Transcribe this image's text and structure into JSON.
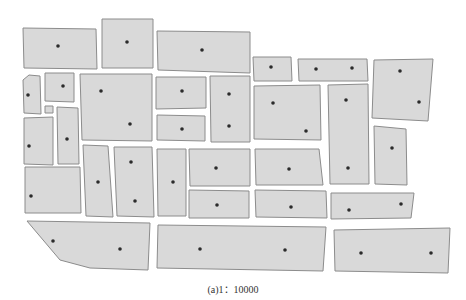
{
  "figure": {
    "caption": "(a)1：10000",
    "scale": "1:10000",
    "colors": {
      "parcel_fill": "#d9d9d9",
      "parcel_stroke": "#8c8c8c",
      "point": "#2b2b2b",
      "background": "#ffffff"
    }
  },
  "parcels": [
    {
      "id": 1,
      "poly": [
        [
          23,
          28
        ],
        [
          96,
          29
        ],
        [
          97,
          69
        ],
        [
          24,
          68
        ]
      ],
      "points": [
        [
          58,
          46
        ]
      ]
    },
    {
      "id": 2,
      "poly": [
        [
          102,
          19
        ],
        [
          153,
          19
        ],
        [
          153,
          68
        ],
        [
          102,
          68
        ]
      ],
      "points": [
        [
          127,
          42
        ]
      ]
    },
    {
      "id": 3,
      "poly": [
        [
          157,
          31
        ],
        [
          250,
          32
        ],
        [
          250,
          73
        ],
        [
          158,
          70
        ]
      ],
      "points": [
        [
          202,
          50
        ]
      ]
    },
    {
      "id": 4,
      "poly": [
        [
          253,
          57
        ],
        [
          291,
          57
        ],
        [
          292,
          81
        ],
        [
          254,
          81
        ]
      ],
      "points": [
        [
          271,
          67
        ]
      ]
    },
    {
      "id": 5,
      "poly": [
        [
          298,
          59
        ],
        [
          367,
          59
        ],
        [
          368,
          81
        ],
        [
          299,
          81
        ]
      ],
      "points": [
        [
          316,
          69
        ],
        [
          352,
          68
        ]
      ]
    },
    {
      "id": 6,
      "poly": [
        [
          374,
          60
        ],
        [
          433,
          59
        ],
        [
          428,
          121
        ],
        [
          372,
          118
        ]
      ],
      "points": [
        [
          400,
          71
        ],
        [
          419,
          102
        ]
      ]
    },
    {
      "id": 7,
      "poly": [
        [
          29,
          75
        ],
        [
          40,
          76
        ],
        [
          41,
          114
        ],
        [
          24,
          113
        ],
        [
          23,
          80
        ]
      ],
      "points": [
        [
          28,
          95
        ]
      ]
    },
    {
      "id": 8,
      "poly": [
        [
          45,
          73
        ],
        [
          74,
          73
        ],
        [
          74,
          102
        ],
        [
          45,
          101
        ]
      ],
      "points": [
        [
          63,
          86
        ]
      ]
    },
    {
      "id": 9,
      "poly": [
        [
          45,
          106
        ],
        [
          53,
          106
        ],
        [
          53,
          113
        ],
        [
          45,
          113
        ]
      ],
      "points": []
    },
    {
      "id": 10,
      "poly": [
        [
          80,
          74
        ],
        [
          152,
          74
        ],
        [
          152,
          141
        ],
        [
          82,
          140
        ]
      ],
      "points": [
        [
          101,
          91
        ],
        [
          130,
          124
        ]
      ]
    },
    {
      "id": 11,
      "poly": [
        [
          156,
          77
        ],
        [
          206,
          77
        ],
        [
          206,
          108
        ],
        [
          156,
          109
        ]
      ],
      "points": [
        [
          182,
          91
        ]
      ]
    },
    {
      "id": 12,
      "poly": [
        [
          157,
          115
        ],
        [
          205,
          116
        ],
        [
          205,
          141
        ],
        [
          157,
          140
        ]
      ],
      "points": [
        [
          182,
          129
        ]
      ]
    },
    {
      "id": 13,
      "poly": [
        [
          210,
          76
        ],
        [
          250,
          76
        ],
        [
          250,
          142
        ],
        [
          211,
          142
        ]
      ],
      "points": [
        [
          229,
          94
        ],
        [
          229,
          126
        ]
      ]
    },
    {
      "id": 14,
      "poly": [
        [
          254,
          86
        ],
        [
          320,
          85
        ],
        [
          321,
          140
        ],
        [
          254,
          139
        ]
      ],
      "points": [
        [
          273,
          103
        ],
        [
          306,
          131
        ]
      ]
    },
    {
      "id": 15,
      "poly": [
        [
          328,
          85
        ],
        [
          368,
          84
        ],
        [
          369,
          184
        ],
        [
          330,
          184
        ]
      ],
      "points": [
        [
          346,
          100
        ],
        [
          348,
          168
        ]
      ]
    },
    {
      "id": 16,
      "poly": [
        [
          374,
          126
        ],
        [
          406,
          129
        ],
        [
          407,
          185
        ],
        [
          375,
          184
        ]
      ],
      "points": [
        [
          392,
          148
        ]
      ]
    },
    {
      "id": 17,
      "poly": [
        [
          24,
          118
        ],
        [
          53,
          117
        ],
        [
          53,
          165
        ],
        [
          24,
          164
        ]
      ],
      "points": [
        [
          29,
          146
        ]
      ]
    },
    {
      "id": 18,
      "poly": [
        [
          57,
          107
        ],
        [
          78,
          108
        ],
        [
          79,
          164
        ],
        [
          58,
          164
        ]
      ],
      "points": [
        [
          67,
          139
        ]
      ]
    },
    {
      "id": 19,
      "poly": [
        [
          25,
          167
        ],
        [
          80,
          167
        ],
        [
          81,
          213
        ],
        [
          25,
          213
        ]
      ],
      "points": [
        [
          31,
          196
        ]
      ]
    },
    {
      "id": 20,
      "poly": [
        [
          83,
          145
        ],
        [
          108,
          146
        ],
        [
          113,
          217
        ],
        [
          86,
          216
        ]
      ],
      "points": [
        [
          98,
          182
        ]
      ]
    },
    {
      "id": 21,
      "poly": [
        [
          114,
          147
        ],
        [
          152,
          147
        ],
        [
          154,
          217
        ],
        [
          117,
          216
        ]
      ],
      "points": [
        [
          131,
          162
        ],
        [
          135,
          201
        ]
      ]
    },
    {
      "id": 22,
      "poly": [
        [
          157,
          149
        ],
        [
          186,
          149
        ],
        [
          186,
          216
        ],
        [
          158,
          216
        ]
      ],
      "points": [
        [
          173,
          182
        ]
      ]
    },
    {
      "id": 23,
      "poly": [
        [
          189,
          149
        ],
        [
          250,
          149
        ],
        [
          250,
          186
        ],
        [
          190,
          186
        ]
      ],
      "points": [
        [
          216,
          168
        ]
      ]
    },
    {
      "id": 24,
      "poly": [
        [
          189,
          190
        ],
        [
          249,
          191
        ],
        [
          249,
          218
        ],
        [
          189,
          218
        ]
      ],
      "points": [
        [
          217,
          205
        ]
      ]
    },
    {
      "id": 25,
      "poly": [
        [
          255,
          149
        ],
        [
          319,
          149
        ],
        [
          323,
          185
        ],
        [
          256,
          185
        ]
      ],
      "points": [
        [
          289,
          169
        ]
      ]
    },
    {
      "id": 26,
      "poly": [
        [
          255,
          190
        ],
        [
          326,
          191
        ],
        [
          327,
          218
        ],
        [
          256,
          217
        ]
      ],
      "points": [
        [
          291,
          207
        ]
      ]
    },
    {
      "id": 27,
      "poly": [
        [
          331,
          193
        ],
        [
          414,
          193
        ],
        [
          411,
          218
        ],
        [
          331,
          219
        ]
      ],
      "points": [
        [
          349,
          210
        ],
        [
          401,
          204
        ]
      ]
    },
    {
      "id": 28,
      "poly": [
        [
          27,
          221
        ],
        [
          150,
          223
        ],
        [
          148,
          270
        ],
        [
          90,
          268
        ],
        [
          60,
          260
        ]
      ],
      "points": [
        [
          53,
          241
        ],
        [
          120,
          249
        ]
      ]
    },
    {
      "id": 29,
      "poly": [
        [
          158,
          225
        ],
        [
          326,
          227
        ],
        [
          323,
          271
        ],
        [
          157,
          268
        ]
      ],
      "points": [
        [
          200,
          249
        ],
        [
          285,
          250
        ]
      ]
    },
    {
      "id": 30,
      "poly": [
        [
          334,
          230
        ],
        [
          450,
          228
        ],
        [
          448,
          273
        ],
        [
          335,
          271
        ]
      ],
      "points": [
        [
          361,
          253
        ],
        [
          431,
          253
        ]
      ]
    }
  ]
}
